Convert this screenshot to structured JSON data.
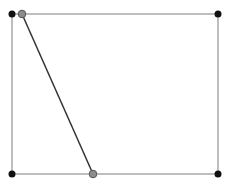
{
  "diagram": {
    "width": 229,
    "height": 182,
    "colors": {
      "background": "#ffffff",
      "edge": "#a8a8a8",
      "diagonal": "#333333",
      "vertex": "#111111",
      "handle_fill": "#8c8c8c",
      "handle_stroke": "#555555"
    },
    "rectangle": {
      "x1": 12,
      "y1": 14,
      "x2": 218,
      "y2": 174
    },
    "vertices": [
      {
        "id": "top-left",
        "x": 12,
        "y": 14
      },
      {
        "id": "top-right",
        "x": 218,
        "y": 14
      },
      {
        "id": "bottom-left",
        "x": 12,
        "y": 174
      },
      {
        "id": "bottom-right",
        "x": 218,
        "y": 174
      }
    ],
    "diagonal": {
      "start": {
        "id": "top-handle",
        "x": 22,
        "y": 14
      },
      "end": {
        "id": "bottom-handle",
        "x": 93,
        "y": 174
      }
    }
  }
}
